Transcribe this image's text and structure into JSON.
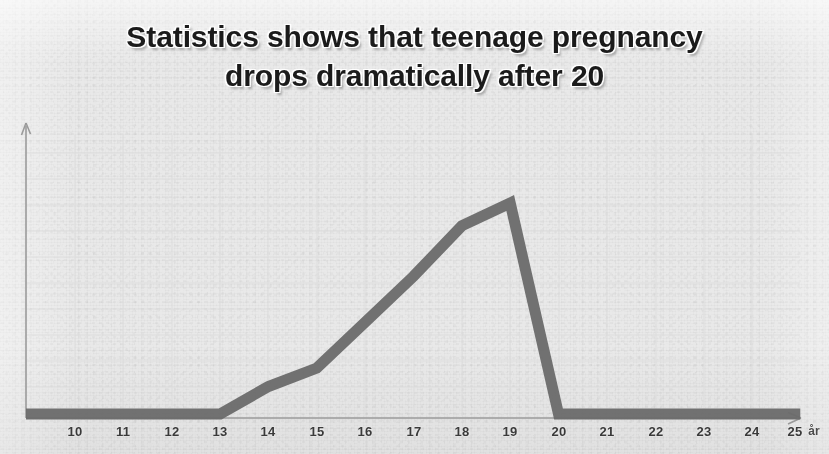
{
  "title": {
    "line1": "Statistics shows that teenage pregnancy",
    "line2": "drops dramatically after 20"
  },
  "colors": {
    "background": "#e9e9e9",
    "line": "#6a6a6a",
    "axis": "#8a8a8a",
    "grid": "#dcdcdc",
    "title_text": "#1b1b1b",
    "tick_text": "#3a3a3a"
  },
  "axis": {
    "x_unit_label": "år",
    "x_tick_labels": [
      "10",
      "11",
      "12",
      "13",
      "14",
      "15",
      "16",
      "17",
      "18",
      "19",
      "20",
      "21",
      "22",
      "23",
      "24",
      "25"
    ],
    "y_tick_labels": [],
    "x_arrow": true,
    "y_arrow": true
  },
  "chart_data": {
    "type": "line",
    "title": "Statistics shows that teenage pregnancy drops dramatically after 20",
    "xlabel": "år",
    "ylabel": "",
    "grid": true,
    "legend": null,
    "xlim": [
      10,
      25
    ],
    "ylim": [
      0,
      100
    ],
    "x": [
      10,
      11,
      12,
      13,
      14,
      15,
      16,
      17,
      18,
      19,
      20,
      21,
      22,
      23,
      24,
      25
    ],
    "values": [
      0,
      0,
      0,
      0,
      12,
      20,
      40,
      60,
      82,
      92,
      0,
      0,
      0,
      0,
      0,
      0
    ],
    "series": [
      {
        "name": "Teenage pregnancy rate",
        "values": [
          0,
          0,
          0,
          0,
          12,
          20,
          40,
          60,
          82,
          92,
          0,
          0,
          0,
          0,
          0,
          0
        ]
      }
    ],
    "annotations": [
      {
        "text": "peak at 19",
        "x": 19
      },
      {
        "text": "drops to zero at 20",
        "x": 20
      }
    ]
  }
}
